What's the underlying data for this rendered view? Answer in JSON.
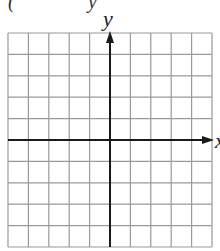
{
  "header": {
    "cropped_text_left": "(",
    "cropped_text_right": "y"
  },
  "axes": {
    "x_label": "x",
    "y_label": "y"
  },
  "grid": {
    "columns": 10,
    "rows": 10,
    "left": 8,
    "top": 33,
    "right": 212,
    "bottom": 247,
    "x_axis_row": 5,
    "y_axis_col": 5,
    "grid_color": "#9a9a9a",
    "axis_color": "#1a1a1a"
  }
}
